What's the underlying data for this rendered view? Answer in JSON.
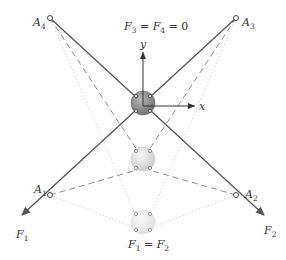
{
  "diagram": {
    "title_equation": {
      "F3": "F",
      "sub3": "3",
      "eq1": " = ",
      "F4": "F",
      "sub4": "4",
      "eq2": " = 0"
    },
    "bottom_equation": {
      "F1": "F",
      "sub1": "1",
      "eq": " = ",
      "F2": "F",
      "sub2": "2"
    },
    "anchors": [
      {
        "id": "A1",
        "label": "A",
        "sub": "1",
        "x": 50,
        "y": 195
      },
      {
        "id": "A2",
        "label": "A",
        "sub": "2",
        "x": 236,
        "y": 195
      },
      {
        "id": "A3",
        "label": "A",
        "sub": "3",
        "x": 236,
        "y": 18
      },
      {
        "id": "A4",
        "label": "A",
        "sub": "4",
        "x": 50,
        "y": 18
      }
    ],
    "forces": [
      {
        "id": "F1",
        "label": "F",
        "sub": "1"
      },
      {
        "id": "F2",
        "label": "F",
        "sub": "2"
      }
    ],
    "axes": {
      "x_label": "x",
      "y_label": "y"
    },
    "colors": {
      "solid_line": "#555555",
      "dashed_line": "#888888",
      "dotted_line": "#c8c8c8",
      "sphere_top": "#8a8a8a",
      "sphere_mid": "#d8d8d8",
      "sphere_bottom": "#ececec"
    }
  }
}
